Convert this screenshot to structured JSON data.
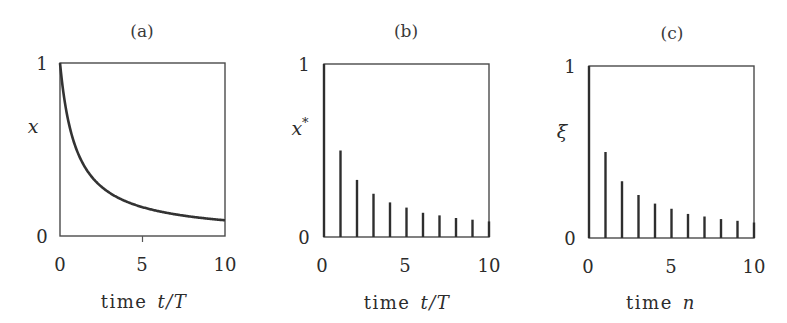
{
  "chart_data": [
    {
      "id": "a",
      "type": "line",
      "title": "(a)",
      "xlabel": "time t/T",
      "xlabel_parts": {
        "word": "time",
        "var": "t/T"
      },
      "ylabel": "x",
      "xlim": [
        0,
        10
      ],
      "ylim": [
        0,
        1
      ],
      "xticks": [
        0,
        5,
        10
      ],
      "yticks": [
        0,
        1
      ],
      "grid": false,
      "function": "x = 1/(1+t/T)",
      "x": [
        0,
        0.25,
        0.5,
        1,
        1.5,
        2,
        3,
        4,
        5,
        6,
        7,
        8,
        9,
        10
      ],
      "values": [
        1.0,
        0.8,
        0.667,
        0.5,
        0.4,
        0.333,
        0.25,
        0.2,
        0.167,
        0.143,
        0.125,
        0.111,
        0.1,
        0.091
      ]
    },
    {
      "id": "b",
      "type": "bar",
      "style": "stem",
      "title": "(b)",
      "xlabel": "time t/T",
      "xlabel_parts": {
        "word": "time",
        "var": "t/T"
      },
      "ylabel": "x*",
      "xlim": [
        0,
        10
      ],
      "ylim": [
        0,
        1
      ],
      "xticks": [
        0,
        5,
        10
      ],
      "yticks": [
        0,
        1
      ],
      "grid": false,
      "x": [
        0,
        1,
        2,
        3,
        4,
        5,
        6,
        7,
        8,
        9,
        10
      ],
      "values": [
        1.0,
        0.5,
        0.33,
        0.25,
        0.2,
        0.17,
        0.14,
        0.125,
        0.11,
        0.1,
        0.09
      ]
    },
    {
      "id": "c",
      "type": "bar",
      "style": "stem",
      "title": "(c)",
      "xlabel": "time n",
      "xlabel_parts": {
        "word": "time",
        "var": "n"
      },
      "ylabel": "ξ",
      "xlim": [
        0,
        10
      ],
      "ylim": [
        0,
        1
      ],
      "xticks": [
        0,
        5,
        10
      ],
      "yticks": [
        0,
        1
      ],
      "grid": false,
      "x": [
        0,
        1,
        2,
        3,
        4,
        5,
        6,
        7,
        8,
        9,
        10
      ],
      "values": [
        1.0,
        0.5,
        0.33,
        0.25,
        0.2,
        0.17,
        0.14,
        0.125,
        0.11,
        0.1,
        0.09
      ]
    }
  ],
  "panels": {
    "a": {
      "title": "(a)",
      "ylabel": "x",
      "ylabel_sup": "",
      "xlabel_word": "time",
      "xlabel_var": "t/T",
      "ytick_top": "1",
      "ytick_bottom": "0",
      "xtick_0": "0",
      "xtick_5": "5",
      "xtick_10": "10"
    },
    "b": {
      "title": "(b)",
      "ylabel": "x",
      "ylabel_sup": "*",
      "xlabel_word": "time",
      "xlabel_var": "t/T",
      "ytick_top": "1",
      "ytick_bottom": "0",
      "xtick_0": "0",
      "xtick_5": "5",
      "xtick_10": "10"
    },
    "c": {
      "title": "(c)",
      "ylabel": "ξ",
      "ylabel_sup": "",
      "xlabel_word": "time",
      "xlabel_var": "n",
      "ytick_top": "1",
      "ytick_bottom": "0",
      "xtick_0": "0",
      "xtick_5": "5",
      "xtick_10": "10"
    }
  },
  "colors": {
    "line": "#333333",
    "axes": "#4a4a4a",
    "text": "#2c2c2c",
    "background": "#ffffff"
  }
}
